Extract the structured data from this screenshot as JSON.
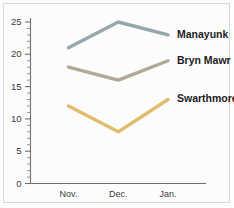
{
  "chart_data": {
    "type": "line",
    "title": "",
    "subtitle": "",
    "xlabel": "",
    "ylabel": "",
    "categories": [
      "Nov.",
      "Dec.",
      "Jan."
    ],
    "ylim": [
      0,
      25
    ],
    "xlim": [
      0,
      3
    ],
    "y_major_ticks": [
      0,
      5,
      10,
      15,
      20,
      25
    ],
    "y_major_tick_labels": [
      "0",
      "5",
      "10",
      "15",
      "20",
      "25"
    ],
    "y_minor_tick_step": 1,
    "grid": false,
    "legend_position": "right-inline-at-line-end",
    "markers": false,
    "series": [
      {
        "name": "Manayunk",
        "values": [
          21,
          25,
          23
        ],
        "color": "#94a8ac",
        "label_color": "#1c1c1e"
      },
      {
        "name": "Bryn Mawr",
        "values": [
          18,
          16,
          19
        ],
        "color": "#b0a993",
        "label_color": "#1c1c1e"
      },
      {
        "name": "Swarthmore",
        "values": [
          12,
          8,
          13
        ],
        "color": "#e0bc6d",
        "label_color": "#1c1c1e"
      }
    ]
  },
  "figure": {
    "background_color": "#fcfcfc",
    "border_color": "#d8d8d8",
    "axis_color": "#6e6e6e",
    "tick_label_color": "#39393c"
  }
}
